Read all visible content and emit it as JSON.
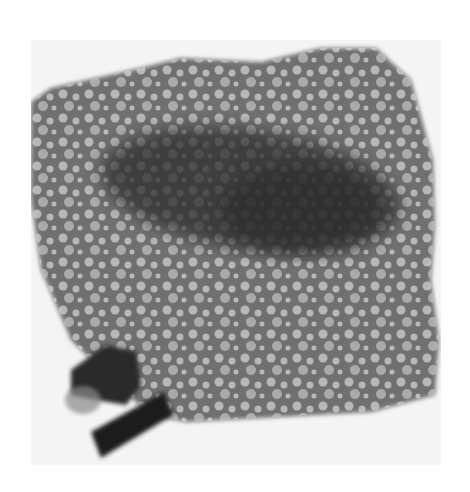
{
  "image": {
    "description": "Grayscale micrograph of a vesicular/porous particle with a dark central region and a dark fragment at lower left",
    "colors": {
      "background": "#ffffff",
      "field": "#f4f4f4",
      "particle": "#6a6a6a",
      "core": "#2e2e2e",
      "vesicle": "#c9c9c9",
      "fragment": "#1e1e1e"
    }
  }
}
